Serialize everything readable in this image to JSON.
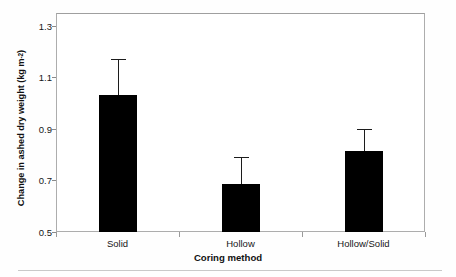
{
  "chart_data": {
    "type": "bar",
    "title": "",
    "subtitle": "",
    "xlabel": "Coring method",
    "ylabel": "Change in ashed dry weight (kg m",
    "ylabel_sup": "-2",
    "ylabel_tail": ")",
    "categories": [
      "Solid",
      "Hollow",
      "Hollow/Solid"
    ],
    "values": [
      1.03,
      0.685,
      0.815
    ],
    "errors_upper": [
      0.14,
      0.105,
      0.085
    ],
    "errors_lower": [
      0,
      0,
      0
    ],
    "error_type": "upper-only standard error whisker",
    "ylim": [
      0.5,
      1.35
    ],
    "yticks": [
      0.5,
      0.7,
      0.9,
      1.1,
      1.3
    ],
    "ytick_labels": [
      "0.5",
      "0.7",
      "0.9",
      "1.1",
      "1.3"
    ],
    "grid": false,
    "legend": false,
    "legend_position": "none",
    "bar_color": "#000000",
    "frame_color": "#adadad",
    "series": [
      {
        "name": "Change in ashed dry weight",
        "values": [
          1.03,
          0.685,
          0.815
        ],
        "errors_upper": [
          0.14,
          0.105,
          0.085
        ]
      }
    ],
    "annotations": []
  },
  "axes": {
    "y_tick_labels": [
      "1.3",
      "1.1",
      "0.9",
      "0.7",
      "0.5"
    ],
    "x_tick_labels": [
      "Solid",
      "Hollow",
      "Hollow/Solid"
    ],
    "x_axis_title": "Coring method"
  }
}
